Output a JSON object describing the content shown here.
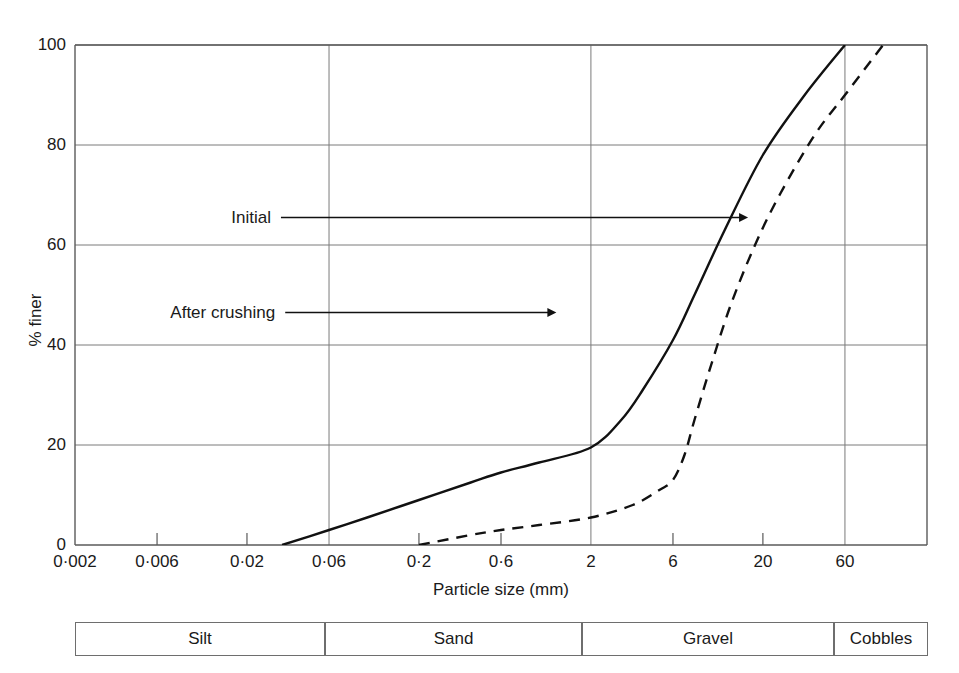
{
  "chart_data": {
    "type": "line",
    "title": "",
    "xlabel": "Particle size (mm)",
    "ylabel": "% finer",
    "xscale": "log",
    "xlim": [
      0.002,
      180
    ],
    "ylim": [
      0,
      100
    ],
    "grid": true,
    "legend_position": "inline-annotations",
    "xticks": [
      {
        "value": 0.002,
        "label": "0·002"
      },
      {
        "value": 0.006,
        "label": "0·006"
      },
      {
        "value": 0.02,
        "label": "0·02"
      },
      {
        "value": 0.06,
        "label": "0·06"
      },
      {
        "value": 0.2,
        "label": "0·2"
      },
      {
        "value": 0.6,
        "label": "0·6"
      },
      {
        "value": 2,
        "label": "2"
      },
      {
        "value": 6,
        "label": "6"
      },
      {
        "value": 20,
        "label": "20"
      },
      {
        "value": 60,
        "label": "60"
      }
    ],
    "yticks": [
      {
        "value": 0,
        "label": "0"
      },
      {
        "value": 20,
        "label": "20"
      },
      {
        "value": 40,
        "label": "40"
      },
      {
        "value": 60,
        "label": "60"
      },
      {
        "value": 80,
        "label": "80"
      },
      {
        "value": 100,
        "label": "100"
      }
    ],
    "gridlines_x": [
      0.06,
      2,
      60
    ],
    "gridlines_y": [
      20,
      40,
      60,
      80,
      100
    ],
    "series": [
      {
        "name": "After crushing",
        "style": "solid",
        "color": "#111111",
        "points": [
          {
            "x": 0.032,
            "y": 0
          },
          {
            "x": 0.06,
            "y": 3
          },
          {
            "x": 0.1,
            "y": 5.5
          },
          {
            "x": 0.2,
            "y": 9
          },
          {
            "x": 0.4,
            "y": 12.5
          },
          {
            "x": 0.6,
            "y": 14.5
          },
          {
            "x": 1.0,
            "y": 16.5
          },
          {
            "x": 2.0,
            "y": 19.5
          },
          {
            "x": 3.0,
            "y": 25
          },
          {
            "x": 4.0,
            "y": 31
          },
          {
            "x": 6.0,
            "y": 41
          },
          {
            "x": 8.0,
            "y": 50
          },
          {
            "x": 12.0,
            "y": 63
          },
          {
            "x": 20.0,
            "y": 78
          },
          {
            "x": 35.0,
            "y": 90
          },
          {
            "x": 60.0,
            "y": 100
          }
        ]
      },
      {
        "name": "Initial",
        "style": "dashed",
        "color": "#111111",
        "points": [
          {
            "x": 0.2,
            "y": 0
          },
          {
            "x": 0.4,
            "y": 2
          },
          {
            "x": 0.6,
            "y": 3
          },
          {
            "x": 1.0,
            "y": 4
          },
          {
            "x": 2.0,
            "y": 5.5
          },
          {
            "x": 3.5,
            "y": 8
          },
          {
            "x": 5.0,
            "y": 11
          },
          {
            "x": 6.0,
            "y": 13
          },
          {
            "x": 7.0,
            "y": 18
          },
          {
            "x": 8.0,
            "y": 25
          },
          {
            "x": 10.0,
            "y": 36
          },
          {
            "x": 13.0,
            "y": 48
          },
          {
            "x": 18.0,
            "y": 60
          },
          {
            "x": 25.0,
            "y": 70
          },
          {
            "x": 40.0,
            "y": 82
          },
          {
            "x": 60.0,
            "y": 90
          },
          {
            "x": 100.0,
            "y": 100
          }
        ]
      }
    ],
    "annotations": [
      {
        "text": "Initial",
        "label_x": 0.23,
        "label_y": 0.345,
        "arrow_to_x": 0.79,
        "arrow_to_y": 0.345
      },
      {
        "text": "After crushing",
        "label_x": 0.235,
        "label_y": 0.535,
        "arrow_to_x": 0.565,
        "arrow_to_y": 0.535
      }
    ]
  },
  "classification_bar": {
    "name": "soil-classification-scale",
    "cells": [
      {
        "label": "Silt",
        "left": 75,
        "width": 250
      },
      {
        "label": "Sand",
        "left": 325,
        "width": 257
      },
      {
        "label": "Gravel",
        "left": 582,
        "width": 252
      },
      {
        "label": "Cobbles",
        "left": 834,
        "width": 94
      }
    ]
  },
  "colors": {
    "axis": "#5a5a5a",
    "grid": "#7a7a7a",
    "curve": "#111111",
    "text": "#1a1a1a",
    "background": "#ffffff"
  }
}
